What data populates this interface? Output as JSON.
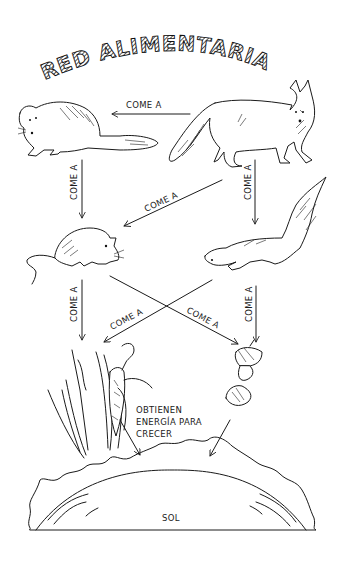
{
  "title": "RED ALIMENTARIA",
  "organisms": {
    "fox": "zorro",
    "weasel": "comadreja",
    "mouse": "ratón",
    "squirrel": "ardilla",
    "plants": "plantas",
    "acorns": "bellotas",
    "sun": "SOL"
  },
  "relations": [
    {
      "id": "fox-weasel",
      "label": "COME A"
    },
    {
      "id": "weasel-mouse",
      "label": "COME A"
    },
    {
      "id": "fox-mouse",
      "label": "COME A"
    },
    {
      "id": "fox-squirrel",
      "label": "COME A"
    },
    {
      "id": "mouse-plants",
      "label": "COME A"
    },
    {
      "id": "squirrel-plants",
      "label": "COME A"
    },
    {
      "id": "mouse-acorns",
      "label": "COME A"
    },
    {
      "id": "squirrel-acorns",
      "label": "COME A"
    }
  ],
  "energy_note": {
    "line1": "OBTIENEN",
    "line2": "ENERGÍA PARA",
    "line3": "CRECER"
  },
  "sun_label": "SOL"
}
